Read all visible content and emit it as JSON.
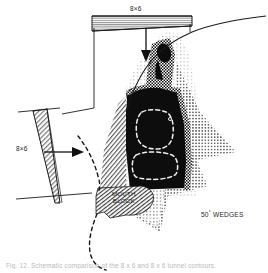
{
  "figure": {
    "caption": "Fig. 12. Schematic comparison of the 8 x 6 and 8 x 6 tunnel contours.",
    "labels": {
      "top_wedge": "8×6",
      "left_wedge": "8×6",
      "mouth_block_line1": "MOUTH",
      "mouth_block_line2": "BLOCK",
      "wedges_value": "50",
      "wedges_degree": "°",
      "wedges_text": "WEDGES"
    },
    "colors": {
      "ink": "#1a1a1a",
      "paper": "#ffffff",
      "solid_fill": "#0d0d0d",
      "light_hatch": "#9a9a9a",
      "stipple": "#6e6e6e",
      "dashed_white": "#f2f2f2"
    },
    "regions": [
      {
        "name": "top-wedge-triangle",
        "fill": "horizontal-hatch",
        "orientation": "horizontal-taper-right"
      },
      {
        "name": "left-wedge-triangle",
        "fill": "diagonal-hatch",
        "orientation": "vertical-taper-down"
      },
      {
        "name": "nozzle-core",
        "fill": "solid-black"
      },
      {
        "name": "checker-band",
        "fill": "checkerboard"
      },
      {
        "name": "stipple-fan",
        "fill": "dot-stipple"
      },
      {
        "name": "mouth-block",
        "fill": "diagonal-hatch"
      },
      {
        "name": "inner-outline-upper",
        "fill": "none",
        "stroke": "white-dashed"
      },
      {
        "name": "inner-outline-lower",
        "fill": "none",
        "stroke": "white-dashed"
      }
    ]
  }
}
